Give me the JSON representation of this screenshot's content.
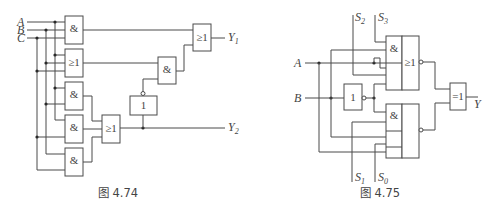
{
  "figures": [
    {
      "caption": "图 4.74",
      "inputs": [
        {
          "name": "A"
        },
        {
          "name": "B"
        },
        {
          "name": "C"
        }
      ],
      "outputs": [
        {
          "name": "Y",
          "sub": "1"
        },
        {
          "name": "Y",
          "sub": "2"
        }
      ],
      "gates": [
        {
          "id": "g1",
          "type": "AND",
          "symbol": "&"
        },
        {
          "id": "g2",
          "type": "OR",
          "symbol": "≥1"
        },
        {
          "id": "g3",
          "type": "AND",
          "symbol": "&"
        },
        {
          "id": "g4",
          "type": "AND",
          "symbol": "&"
        },
        {
          "id": "g5",
          "type": "AND",
          "symbol": "&"
        },
        {
          "id": "g6",
          "type": "OR",
          "symbol": "≥1"
        },
        {
          "id": "g7",
          "type": "NOT",
          "symbol": "1"
        },
        {
          "id": "g8",
          "type": "AND",
          "symbol": "&"
        },
        {
          "id": "g9",
          "type": "OR",
          "symbol": "≥1"
        }
      ]
    },
    {
      "caption": "图 4.75",
      "inputs": [
        {
          "name": "A"
        },
        {
          "name": "B"
        }
      ],
      "selects": [
        {
          "name": "S",
          "sub": "2"
        },
        {
          "name": "S",
          "sub": "3"
        },
        {
          "name": "S",
          "sub": "1"
        },
        {
          "name": "S",
          "sub": "0"
        }
      ],
      "outputs": [
        {
          "name": "Y"
        }
      ],
      "gates": [
        {
          "id": "h1",
          "type": "AND-OR-INVERT",
          "symbol_and": "&",
          "symbol_or": "≥1"
        },
        {
          "id": "h2",
          "type": "NOT",
          "symbol": "1"
        },
        {
          "id": "h3",
          "type": "AND-OR-INVERT",
          "symbol_and": "&"
        },
        {
          "id": "h4",
          "type": "XOR",
          "symbol": "=1"
        }
      ]
    }
  ]
}
